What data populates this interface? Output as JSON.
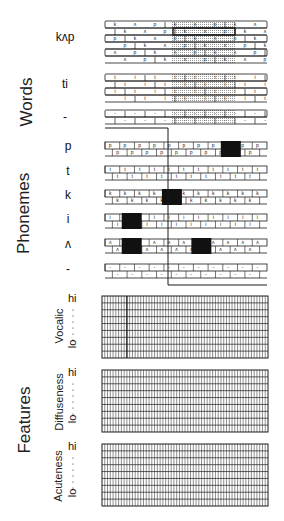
{
  "sections": {
    "words": "Words",
    "phonemes": "Phonemes",
    "features": "Features"
  },
  "word_rows": [
    {
      "label": "kʌp",
      "unit_seq": [
        "k",
        "ʌ",
        "p"
      ],
      "lines": 6
    },
    {
      "label": "ti",
      "unit_seq": [
        "t",
        "i"
      ],
      "lines": 4
    },
    {
      "label": "-",
      "unit_seq": [
        "-"
      ],
      "lines": 2
    }
  ],
  "phoneme_rows": [
    {
      "label": "p",
      "glyph": "p",
      "active": [
        8
      ]
    },
    {
      "label": "t",
      "glyph": "t",
      "active": []
    },
    {
      "label": "k",
      "glyph": "k",
      "active": [
        4
      ]
    },
    {
      "label": "i",
      "glyph": "i",
      "active": [
        1
      ]
    },
    {
      "label": "ʌ",
      "glyph": "ʌ",
      "active": [
        1,
        6
      ]
    },
    {
      "label": "-",
      "glyph": "-",
      "active": []
    }
  ],
  "feature_panels": [
    {
      "name": "Vocalic",
      "hi": "hi",
      "lo": "lo",
      "rows": 9,
      "cols": 60,
      "highlight_col": 9
    },
    {
      "name": "Diffuseness",
      "hi": "hi",
      "lo": "lo",
      "rows": 9,
      "cols": 60,
      "highlight_col": null
    },
    {
      "name": "Acuteness",
      "hi": "hi",
      "lo": "lo",
      "rows": 9,
      "cols": 60,
      "highlight_col": null
    }
  ],
  "colors": {
    "ink": "#1a1a1a",
    "fill": "#111111",
    "shade": "#bbbbbb"
  }
}
